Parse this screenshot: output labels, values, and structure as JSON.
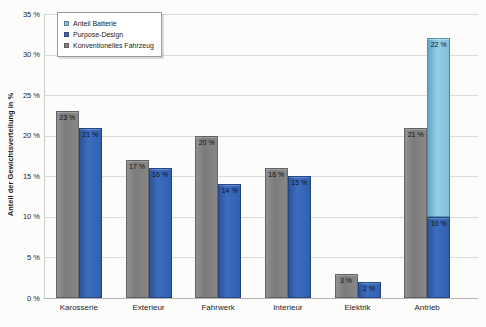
{
  "chart_data": {
    "type": "bar",
    "title": "",
    "xlabel": "",
    "ylabel": "Anteil der Gewichtsverteilung in %",
    "ylim": [
      0,
      35
    ],
    "ytick_step": 5,
    "yticks": [
      "0 %",
      "5 %",
      "10 %",
      "15 %",
      "20 %",
      "25 %",
      "30 %",
      "35 %"
    ],
    "grid": true,
    "label_format": "{v} %",
    "categories": [
      "Karosserie",
      "Exterieur",
      "Fahrwerk",
      "Interieur",
      "Elektrik",
      "Antrieb"
    ],
    "series": [
      {
        "name": "Konventionelles Fahrzeug",
        "key": "conventional",
        "color": "#818181",
        "values": [
          23,
          17,
          20,
          16,
          3,
          21
        ]
      },
      {
        "name": "Purpose-Design",
        "key": "purpose",
        "color": "#3565b4",
        "values": [
          21,
          16,
          14,
          15,
          2,
          10
        ]
      },
      {
        "name": "Anteil Batterie",
        "key": "battery",
        "color": "#85c4df",
        "stacked_on": "Purpose-Design",
        "values": [
          null,
          null,
          null,
          null,
          null,
          22
        ]
      }
    ],
    "data_labels_visible": true,
    "legend": {
      "position": "top-left",
      "entries": [
        {
          "label": "Anteil Batterie",
          "color": "#85c4df",
          "key": "battery"
        },
        {
          "label": "Purpose-Design",
          "color": "#3565b4",
          "key": "purpose"
        },
        {
          "label": "Konventionelles Fahrzeug",
          "color": "#818181",
          "key": "conventional"
        }
      ]
    }
  }
}
